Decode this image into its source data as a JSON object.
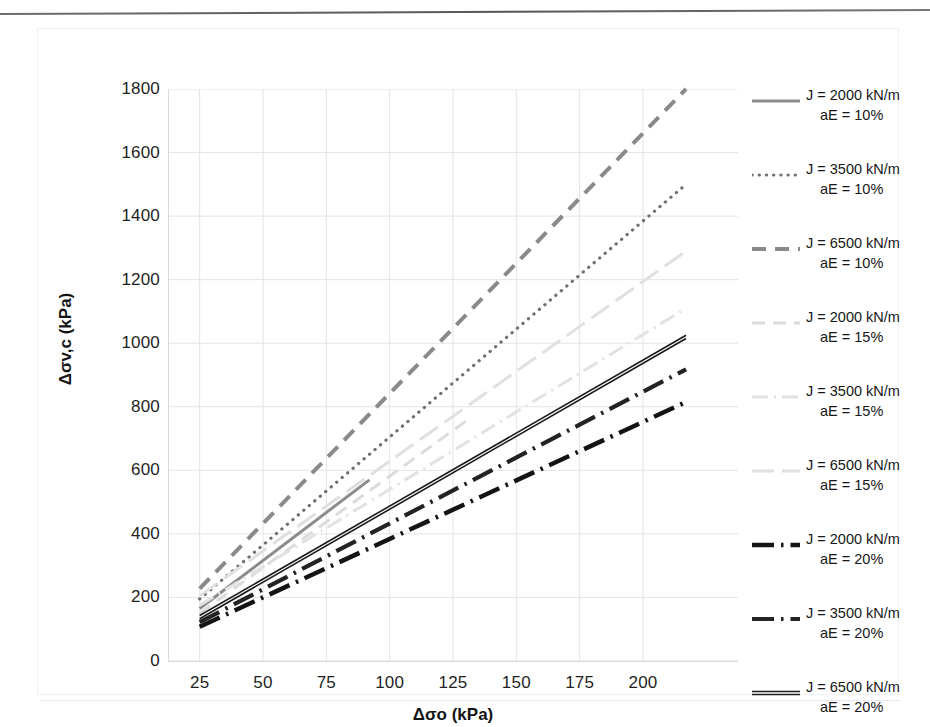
{
  "chart_data": {
    "type": "line",
    "title": "",
    "xlabel": "Δσo (kPa)",
    "ylabel": "Δσv,c (kPa)",
    "xlim": [
      12.5,
      237.5
    ],
    "ylim": [
      0,
      1800
    ],
    "xticks": [
      25,
      50,
      75,
      100,
      125,
      150,
      175,
      200
    ],
    "yticks": [
      0,
      200,
      400,
      600,
      800,
      1000,
      1200,
      1400,
      1600,
      1800
    ],
    "grid": true,
    "legend_position": "right",
    "series": [
      {
        "name": "J = 2000 kN/m  aE = 10%",
        "J": "2000 kN/m",
        "aE": "10%",
        "style": "solid",
        "color": "#8c8c8c",
        "width": 3.0,
        "x": [
          25,
          92
        ],
        "y": [
          165,
          570
        ]
      },
      {
        "name": "J = 3500 kN/m  aE = 10%",
        "J": "3500 kN/m",
        "aE": "10%",
        "style": "dotted",
        "color": "#70706f",
        "width": 3.2,
        "x": [
          25,
          217
        ],
        "y": [
          195,
          1500
        ]
      },
      {
        "name": "J = 6500 kN/m  aE = 10%",
        "J": "6500 kN/m",
        "aE": "10%",
        "style": "dashed",
        "color": "#8a8a8a",
        "width": 4.0,
        "x": [
          25,
          217
        ],
        "y": [
          228,
          1800
        ]
      },
      {
        "name": "J = 2000 kN/m  aE = 15%",
        "J": "2000 kN/m",
        "aE": "15%",
        "style": "dashed-light",
        "color": "#dcdcdc",
        "width": 3.0,
        "x": [
          25,
          131
        ],
        "y": [
          150,
          760
        ]
      },
      {
        "name": "J = 3500 kN/m  aE = 15%",
        "J": "3500 kN/m",
        "aE": "15%",
        "style": "dash-dot-light",
        "color": "#e2e2e2",
        "width": 3.0,
        "x": [
          25,
          217
        ],
        "y": [
          175,
          1110
        ]
      },
      {
        "name": "J = 6500 kN/m  aE = 15%",
        "J": "6500 kN/m",
        "aE": "15%",
        "style": "long-dash-light",
        "color": "#e0e0e0",
        "width": 3.0,
        "x": [
          25,
          217
        ],
        "y": [
          205,
          1290
        ]
      },
      {
        "name": "J = 2000 kN/m  aE = 20%",
        "J": "2000 kN/m",
        "aE": "20%",
        "style": "dash-dot-heavy",
        "color": "#141414",
        "width": 4.5,
        "x": [
          25,
          217
        ],
        "y": [
          108,
          815
        ]
      },
      {
        "name": "J = 3500 kN/m  aE = 20%",
        "J": "3500 kN/m",
        "aE": "20%",
        "style": "dash-dot-heavy",
        "color": "#232323",
        "width": 4.2,
        "x": [
          25,
          217
        ],
        "y": [
          122,
          918
        ]
      },
      {
        "name": "J = 6500 kN/m  aE = 20%",
        "J": "6500 kN/m",
        "aE": "20%",
        "style": "double-solid",
        "color": "#1a1a1a",
        "width": 4.0,
        "x": [
          25,
          217
        ],
        "y": [
          138,
          1020
        ]
      }
    ]
  },
  "axes": {
    "x_title": "Δσo (kPa)",
    "y_title": "Δσv,c (kPa)",
    "x_tick_labels": [
      "25",
      "50",
      "75",
      "100",
      "125",
      "150",
      "175",
      "200"
    ],
    "y_tick_labels": [
      "0",
      "200",
      "400",
      "600",
      "800",
      "1000",
      "1200",
      "1400",
      "1600",
      "1800"
    ]
  },
  "legend": {
    "entries": [
      {
        "line1": "J = 2000 kN/m",
        "line2": "aE = 10%"
      },
      {
        "line1": "J = 3500 kN/m",
        "line2": "aE = 10%"
      },
      {
        "line1": "J = 6500 kN/m",
        "line2": "aE = 10%"
      },
      {
        "line1": "J = 2000 kN/m",
        "line2": "aE = 15%"
      },
      {
        "line1": "J = 3500 kN/m",
        "line2": "aE = 15%"
      },
      {
        "line1": "J = 6500 kN/m",
        "line2": "aE = 15%"
      },
      {
        "line1": "J = 2000 kN/m",
        "line2": "aE = 20%"
      },
      {
        "line1": "J = 3500 kN/m",
        "line2": "aE = 20%"
      },
      {
        "line1": "J = 6500 kN/m",
        "line2": "aE = 20%"
      }
    ]
  },
  "colors": {
    "grid": "#e3e3e8",
    "axis": "#d8d8dd",
    "text": "#1a1a1a",
    "light_series": "#e0e0e0",
    "mid_series": "#8a8a8a",
    "dark_series": "#141414"
  }
}
